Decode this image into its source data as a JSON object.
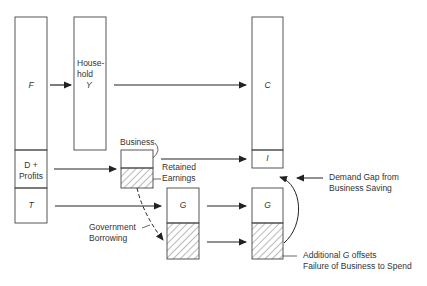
{
  "diagram": {
    "boxes": {
      "factor": {
        "label": "F"
      },
      "profits": {
        "label_line1": "D +",
        "label_line2": "Profits"
      },
      "taxes": {
        "label": "T"
      },
      "household": {
        "label_line1": "House-",
        "label_line2": "hold",
        "label_line3": "Y"
      },
      "consumption": {
        "label": "C"
      },
      "investment": {
        "label": "I"
      },
      "business": {
        "label": "Business"
      },
      "government_mid": {
        "label": "G"
      },
      "government_right": {
        "label": "G"
      }
    },
    "annotations": {
      "retained_earnings_line1": "Retained",
      "retained_earnings_line2": "Earnings",
      "government_borrowing_line1": "Government",
      "government_borrowing_line2": "Borrowing",
      "demand_gap_line1": "Demand Gap from",
      "demand_gap_line2": "Business Saving",
      "additional_g_line1_prefix": "Additional ",
      "additional_g_line1_var": "G",
      "additional_g_line1_suffix": " offsets",
      "additional_g_line2": "Failure of Business to Spend"
    },
    "colors": {
      "stroke": "#333333",
      "hatch": "#555555",
      "background": "#ffffff"
    }
  }
}
